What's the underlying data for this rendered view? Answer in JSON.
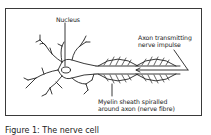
{
  "diagram": {
    "title": "The nerve cell",
    "labels": {
      "nucleus": "Nucleus",
      "axon_line1": "Axon transmitting",
      "axon_line2": "nerve impulse",
      "myelin_line1": "Myelin sheath spiralled",
      "myelin_line2": "around axon (nerve fibre)"
    },
    "caption": "Figure 1: The nerve cell",
    "colors": {
      "stroke": "#222222",
      "border": "#3a3a3a",
      "background": "#ffffff"
    }
  }
}
